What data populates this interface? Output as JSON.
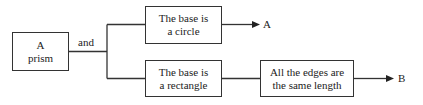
{
  "diagram": {
    "nodes": {
      "prism": {
        "line1": "A",
        "line2": "prism"
      },
      "circle": {
        "line1": "The base is",
        "line2": "a circle"
      },
      "rectangle": {
        "line1": "The base is",
        "line2": "a rectangle"
      },
      "edges": {
        "line1": "All the edges are",
        "line2": "the same length"
      }
    },
    "connector_label": "and",
    "outcomes": {
      "a": "A",
      "b": "B"
    },
    "edges": [
      {
        "from": "prism",
        "to": "circle",
        "label": "and"
      },
      {
        "from": "prism",
        "to": "rectangle",
        "label": "and"
      },
      {
        "from": "circle",
        "to": "A"
      },
      {
        "from": "rectangle",
        "to": "edges"
      },
      {
        "from": "edges",
        "to": "B"
      }
    ],
    "colors": {
      "line": "#333333",
      "background": "#ffffff"
    }
  }
}
